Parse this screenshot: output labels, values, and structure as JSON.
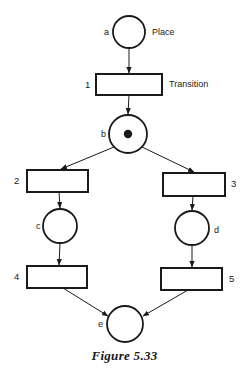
{
  "figure": {
    "caption": "Figure 5.33",
    "caption_x": 124,
    "caption_y": 348,
    "background": "#ffffff",
    "stroke": "#1a1a1a"
  },
  "annotations": [
    {
      "name": "place-annotation",
      "text": "Place",
      "x": 152,
      "y": 28
    },
    {
      "name": "transition-annotation",
      "text": "Transition",
      "x": 169,
      "y": 80
    }
  ],
  "chart_data": {
    "type": "diagram",
    "diagram_kind": "petri-net",
    "title": "Figure 5.33",
    "places": [
      {
        "id": "a",
        "label": "a",
        "cx": 129,
        "cy": 32,
        "r": 16,
        "tokens": 0,
        "label_x": 104,
        "label_y": 28
      },
      {
        "id": "b",
        "label": "b",
        "cx": 128,
        "cy": 134,
        "r": 19,
        "tokens": 1,
        "label_x": 101,
        "label_y": 130
      },
      {
        "id": "c",
        "label": "c",
        "cx": 60,
        "cy": 226,
        "r": 17,
        "tokens": 0,
        "label_x": 36,
        "label_y": 222
      },
      {
        "id": "d",
        "label": "d",
        "cx": 192,
        "cy": 228,
        "r": 17,
        "tokens": 0,
        "label_x": 214,
        "label_y": 226
      },
      {
        "id": "e",
        "label": "e",
        "cx": 125,
        "cy": 324,
        "r": 18,
        "tokens": 0,
        "label_x": 98,
        "label_y": 320
      }
    ],
    "transitions": [
      {
        "id": "1",
        "label": "1",
        "x": 96,
        "y": 74,
        "w": 66,
        "h": 21,
        "label_x": 85,
        "label_y": 80
      },
      {
        "id": "2",
        "label": "2",
        "x": 27,
        "y": 170,
        "w": 61,
        "h": 22,
        "label_x": 14,
        "label_y": 176
      },
      {
        "id": "3",
        "label": "3",
        "x": 163,
        "y": 173,
        "w": 62,
        "h": 23,
        "label_x": 231,
        "label_y": 179
      },
      {
        "id": "4",
        "label": "4",
        "x": 27,
        "y": 266,
        "w": 60,
        "h": 22,
        "label_x": 14,
        "label_y": 272
      },
      {
        "id": "5",
        "label": "5",
        "x": 161,
        "y": 268,
        "w": 61,
        "h": 22,
        "label_x": 229,
        "label_y": 274
      }
    ],
    "arcs": [
      {
        "from": "a",
        "to": "1",
        "x1": 129,
        "y1": 48,
        "x2": 129,
        "y2": 73
      },
      {
        "from": "1",
        "to": "b",
        "x1": 129,
        "y1": 95,
        "x2": 128,
        "y2": 114
      },
      {
        "from": "b",
        "to": "2",
        "x1": 114,
        "y1": 147,
        "x2": 61,
        "y2": 169
      },
      {
        "from": "b",
        "to": "3",
        "x1": 142,
        "y1": 147,
        "x2": 194,
        "y2": 172
      },
      {
        "from": "2",
        "to": "c",
        "x1": 59,
        "y1": 192,
        "x2": 60,
        "y2": 208
      },
      {
        "from": "3",
        "to": "d",
        "x1": 193,
        "y1": 196,
        "x2": 192,
        "y2": 210
      },
      {
        "from": "c",
        "to": "4",
        "x1": 60,
        "y1": 243,
        "x2": 59,
        "y2": 265
      },
      {
        "from": "d",
        "to": "5",
        "x1": 192,
        "y1": 245,
        "x2": 192,
        "y2": 267
      },
      {
        "from": "4",
        "to": "e",
        "x1": 63,
        "y1": 288,
        "x2": 108,
        "y2": 316
      },
      {
        "from": "5",
        "to": "e",
        "x1": 188,
        "y1": 290,
        "x2": 143,
        "y2": 316
      }
    ]
  }
}
